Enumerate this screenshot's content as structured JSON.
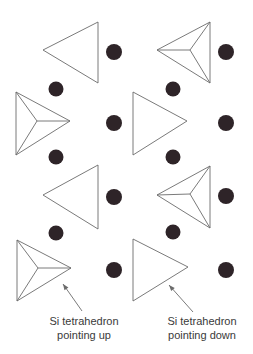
{
  "figure": {
    "width": 253,
    "height": 354,
    "colors": {
      "background": "#ffffff",
      "stroke": "#6b6b6b",
      "dot": "#2e2428",
      "text": "#3a3a3a"
    },
    "tetrahedra": [
      {
        "id": "r1-left",
        "orientation": "down",
        "pointing": "left",
        "points": [
          [
            43,
            50
          ],
          [
            98,
            22
          ],
          [
            98,
            83
          ]
        ]
      },
      {
        "id": "r1-right",
        "orientation": "up",
        "pointing": "left",
        "points": [
          [
            157,
            50
          ],
          [
            210,
            22
          ],
          [
            210,
            83
          ]
        ],
        "apex": [
          190,
          50
        ]
      },
      {
        "id": "r2-left",
        "orientation": "up",
        "pointing": "right",
        "points": [
          [
            16,
            92
          ],
          [
            16,
            155
          ],
          [
            70,
            121
          ]
        ],
        "apex": [
          37,
          121
        ]
      },
      {
        "id": "r2-right",
        "orientation": "down",
        "pointing": "right",
        "points": [
          [
            133,
            92
          ],
          [
            133,
            155
          ],
          [
            187,
            121
          ]
        ]
      },
      {
        "id": "r3-left",
        "orientation": "down",
        "pointing": "left",
        "points": [
          [
            43,
            195
          ],
          [
            98,
            165
          ],
          [
            98,
            229
          ]
        ]
      },
      {
        "id": "r3-right",
        "orientation": "up",
        "pointing": "left",
        "points": [
          [
            157,
            195
          ],
          [
            210,
            166
          ],
          [
            210,
            228
          ]
        ],
        "apex": [
          190,
          194
        ]
      },
      {
        "id": "r4-left",
        "orientation": "up",
        "pointing": "right",
        "points": [
          [
            17,
            240
          ],
          [
            17,
            301
          ],
          [
            71,
            268
          ]
        ],
        "apex": [
          38,
          268
        ]
      },
      {
        "id": "r4-right",
        "orientation": "down",
        "pointing": "right",
        "points": [
          [
            133,
            239
          ],
          [
            133,
            301
          ],
          [
            188,
            267
          ]
        ]
      }
    ],
    "atoms": [
      {
        "cx": 114,
        "cy": 52,
        "r": 8
      },
      {
        "cx": 226,
        "cy": 52,
        "r": 8
      },
      {
        "cx": 56,
        "cy": 89,
        "r": 7.5
      },
      {
        "cx": 173,
        "cy": 89,
        "r": 7.5
      },
      {
        "cx": 114,
        "cy": 123,
        "r": 8
      },
      {
        "cx": 226,
        "cy": 123,
        "r": 8
      },
      {
        "cx": 56,
        "cy": 157,
        "r": 7.5
      },
      {
        "cx": 173,
        "cy": 157,
        "r": 7.5
      },
      {
        "cx": 114,
        "cy": 197,
        "r": 8
      },
      {
        "cx": 226,
        "cy": 196,
        "r": 8
      },
      {
        "cx": 56,
        "cy": 233,
        "r": 7.5
      },
      {
        "cx": 173,
        "cy": 232,
        "r": 7.5
      },
      {
        "cx": 114,
        "cy": 270,
        "r": 8
      },
      {
        "cx": 226,
        "cy": 270,
        "r": 8
      }
    ],
    "annotations": [
      {
        "id": "up",
        "line1": "Si tetrahedron",
        "line2": "pointing up",
        "arrow_from": [
          82,
          311
        ],
        "arrow_to": [
          63,
          284
        ],
        "text_center_x": 84,
        "text_top": 314
      },
      {
        "id": "down",
        "line1": "Si tetrahedron",
        "line2": "pointing down",
        "arrow_from": [
          193,
          312
        ],
        "arrow_to": [
          169,
          285
        ],
        "text_center_x": 202,
        "text_top": 314
      }
    ]
  }
}
